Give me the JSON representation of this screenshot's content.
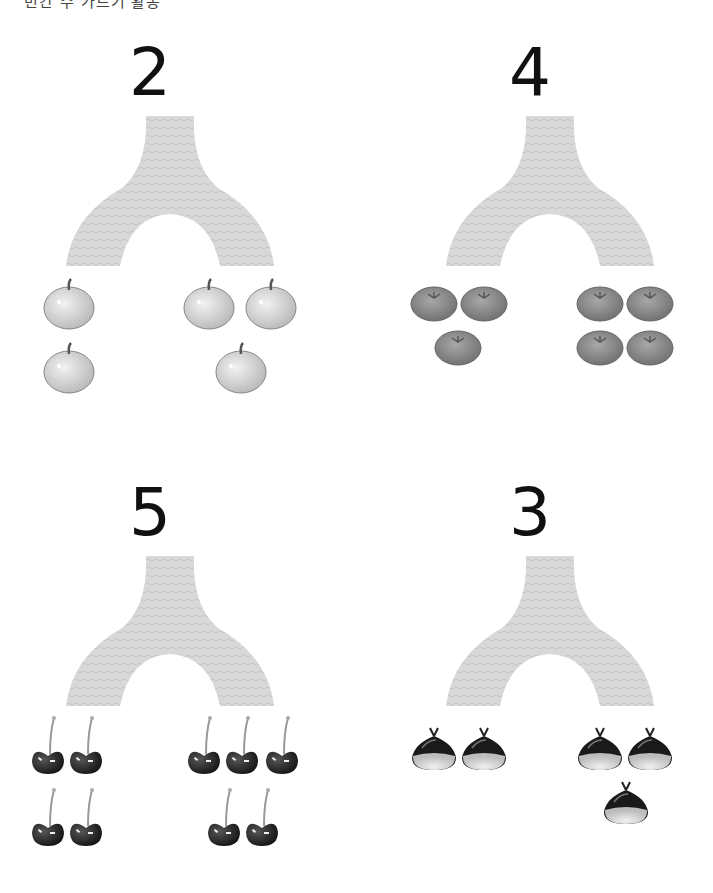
{
  "header": {
    "text": "빈칸 수 가르기 활동"
  },
  "panels": [
    {
      "number": "2",
      "fruit": "apple",
      "left_count": 2,
      "right_count": 3
    },
    {
      "number": "4",
      "fruit": "tomato",
      "left_count": 3,
      "right_count": 4
    },
    {
      "number": "5",
      "fruit": "cherry",
      "left_count": 4,
      "right_count": 5
    },
    {
      "number": "3",
      "fruit": "chestnut",
      "left_count": 2,
      "right_count": 3
    }
  ],
  "colors": {
    "tree": "#d6d6d6",
    "number": "#111111"
  }
}
